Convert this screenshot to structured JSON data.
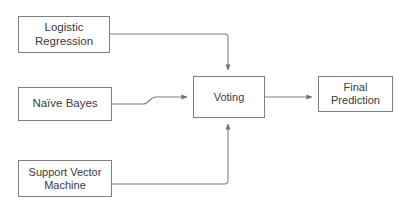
{
  "diagram": {
    "type": "flowchart",
    "canvas": {
      "width": 407,
      "height": 216
    },
    "style": {
      "background_color": "#ffffff",
      "node_fill": "#ffffff",
      "node_border_color": "#808080",
      "text_color": "#3a3a3a",
      "connector_color": "#808080"
    },
    "nodes": [
      {
        "id": "logistic-regression",
        "label": "Logistic Regression",
        "shape": "rectangle",
        "role": "base-model"
      },
      {
        "id": "naive-bayes",
        "label": "Naïve Bayes",
        "shape": "rectangle",
        "role": "base-model"
      },
      {
        "id": "support-vector-machine",
        "label": "Support Vector\nMachine",
        "shape": "rectangle",
        "role": "base-model"
      },
      {
        "id": "voting",
        "label": "Voting",
        "shape": "rectangle",
        "role": "aggregator"
      },
      {
        "id": "final-prediction",
        "label": "Final Prediction",
        "shape": "rectangle",
        "role": "output"
      }
    ],
    "connectors": [
      {
        "id": "logistic-regression-to-voting",
        "from": "logistic-regression",
        "to": "voting",
        "from_side": "right",
        "to_side": "top",
        "arrowhead": "filled-triangle",
        "routing": "orthogonal-elbow"
      },
      {
        "id": "naive-bayes-to-voting",
        "from": "naive-bayes",
        "to": "voting",
        "from_side": "right",
        "to_side": "left",
        "arrowhead": "filled-triangle",
        "routing": "s-curve-step"
      },
      {
        "id": "support-vector-machine-to-voting",
        "from": "support-vector-machine",
        "to": "voting",
        "from_side": "right",
        "to_side": "bottom",
        "arrowhead": "filled-triangle",
        "routing": "orthogonal-elbow"
      },
      {
        "id": "voting-to-final-prediction",
        "from": "voting",
        "to": "final-prediction",
        "from_side": "right",
        "to_side": "left",
        "arrowhead": "filled-triangle",
        "routing": "straight"
      }
    ]
  }
}
